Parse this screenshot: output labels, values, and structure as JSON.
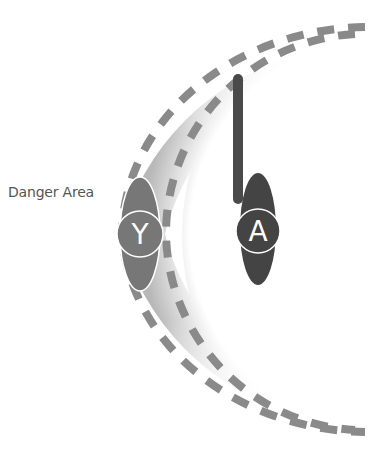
{
  "diagram": {
    "danger_area_label": "Danger Area",
    "nodes": [
      {
        "id": "y",
        "letter": "Y",
        "color": "#777777"
      },
      {
        "id": "a",
        "letter": "A",
        "color": "#444444"
      }
    ],
    "colors": {
      "dash": "#8a8a8a",
      "band_dark": "#bdbdbd",
      "band_light": "#ffffff",
      "bar": "#4a4a4a",
      "outline": "#ffffff"
    }
  }
}
